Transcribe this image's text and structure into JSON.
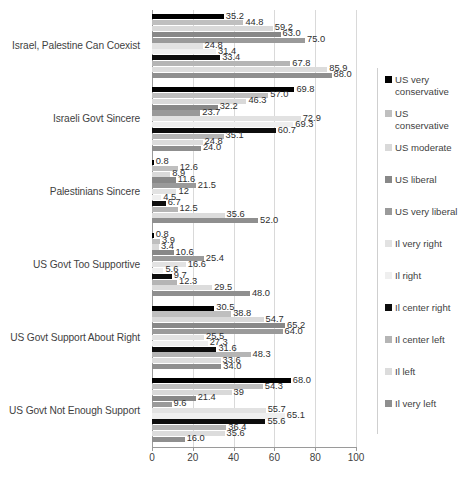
{
  "chart_data": {
    "type": "bar",
    "orientation": "horizontal",
    "title": "",
    "xlabel": "",
    "ylabel": "",
    "xlim": [
      0,
      100
    ],
    "xticks": [
      0,
      20,
      40,
      60,
      80,
      100
    ],
    "grid": true,
    "legend_position": "right",
    "categories": [
      "Israel, Palestine Can Coexist",
      "Israeli Govt Sincere",
      "Palestinians Sincere",
      "US Govt Too Supportive",
      "US Govt Support About Right",
      "US Govt Not Enough Support"
    ],
    "series": [
      {
        "name": "US very conservative",
        "color": "#000000",
        "values": [
          35.2,
          69.8,
          0.8,
          0.8,
          30.5,
          68.0
        ],
        "labels": [
          "35.2",
          "69.8",
          "0.8",
          "0.8",
          "30.5",
          "68.0"
        ]
      },
      {
        "name": "US conservative",
        "color": "#bfbfbf",
        "values": [
          44.8,
          57.0,
          12.6,
          3.9,
          38.8,
          54.3
        ],
        "labels": [
          "44.8",
          "57.0",
          "12.6",
          "3.9",
          "38.8",
          "54.3"
        ]
      },
      {
        "name": "US moderate",
        "color": "#d9d9d9",
        "values": [
          59.2,
          46.3,
          8.9,
          3.4,
          54.7,
          39
        ],
        "labels": [
          "59.2",
          "46.3",
          "8.9",
          "3.4",
          "54.7",
          "39"
        ]
      },
      {
        "name": "US liberal",
        "color": "#888888",
        "values": [
          63.0,
          32.2,
          11.6,
          10.6,
          65.2,
          21.4
        ],
        "labels": [
          "63.0",
          "32.2",
          "11.6",
          "10.6",
          "65.2",
          "21.4"
        ]
      },
      {
        "name": "US very liberal",
        "color": "#9a9a9a",
        "values": [
          75.0,
          23.7,
          21.5,
          25.4,
          64.0,
          9.6
        ],
        "labels": [
          "75.0",
          "23.7",
          "21.5",
          "25.4",
          "64.0",
          "9.6"
        ]
      },
      {
        "name": "Il very right",
        "color": "#e2e2e2",
        "values": [
          24.8,
          72.9,
          12,
          16.6,
          25.5,
          55.7
        ],
        "labels": [
          "24.8",
          "72.9",
          "12",
          "16.6",
          "25.5",
          "55.7"
        ]
      },
      {
        "name": "Il right",
        "color": "#efefef",
        "values": [
          31.4,
          69.3,
          4.5,
          5.6,
          27.3,
          65.1
        ],
        "labels": [
          "31.4",
          "69.3",
          "4.5",
          "5.6",
          "27.3",
          "65.1"
        ]
      },
      {
        "name": "Il center right",
        "color": "#0d0d0d",
        "values": [
          33.4,
          60.7,
          6.7,
          9.7,
          31.6,
          55.6
        ],
        "labels": [
          "33.4",
          "60.7",
          "6.7",
          "9.7",
          "31.6",
          "55.6"
        ]
      },
      {
        "name": "Il center left",
        "color": "#b5b5b5",
        "values": [
          67.8,
          35.1,
          12.5,
          12.3,
          48.3,
          36.4
        ],
        "labels": [
          "67.8",
          "35.1",
          "12.5",
          "12.3",
          "48.3",
          "36.4"
        ]
      },
      {
        "name": "Il left",
        "color": "#dcdcdc",
        "values": [
          85.9,
          24.8,
          35.6,
          29.5,
          33.6,
          35.6
        ],
        "labels": [
          "85.9",
          "24.8",
          "35.6",
          "29.5",
          "33.6",
          "35.6"
        ]
      },
      {
        "name": "Il very left",
        "color": "#8f8f8f",
        "values": [
          88.0,
          24.0,
          52.0,
          48.0,
          34.0,
          16.0
        ],
        "labels": [
          "88.0",
          "24.0",
          "52.0",
          "48.0",
          "34.0",
          "16.0"
        ]
      }
    ]
  },
  "legend": {
    "entries": [
      "US very\nconservative",
      "US\nconservative",
      "US moderate",
      "US liberal",
      "US very liberal",
      "Il very right",
      "Il right",
      "Il center right",
      "Il center left",
      "Il left",
      "Il very left"
    ]
  },
  "axis": {
    "x_tick_labels": [
      "0",
      "20",
      "40",
      "60",
      "80",
      "100"
    ]
  }
}
